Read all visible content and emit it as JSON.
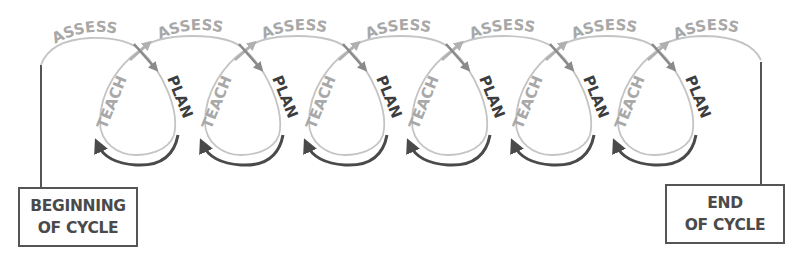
{
  "diagram": {
    "stage_labels": {
      "assess": "ASSESS",
      "plan": "PLAN",
      "teach": "TEACH"
    },
    "loop_count": 6,
    "loops": [
      {
        "assess": "ASSESS",
        "plan": "PLAN",
        "teach": "TEACH"
      },
      {
        "assess": "ASSESS",
        "plan": "PLAN",
        "teach": "TEACH"
      },
      {
        "assess": "ASSESS",
        "plan": "PLAN",
        "teach": "TEACH"
      },
      {
        "assess": "ASSESS",
        "plan": "PLAN",
        "teach": "TEACH"
      },
      {
        "assess": "ASSESS",
        "plan": "PLAN",
        "teach": "TEACH"
      },
      {
        "assess": "ASSESS",
        "plan": "PLAN",
        "teach": "TEACH"
      }
    ],
    "final_assess": "ASSESS",
    "begin_box": {
      "line1": "BEGINNING",
      "line2": "OF CYCLE"
    },
    "end_box": {
      "line1": "END",
      "line2": "OF CYCLE"
    },
    "colors": {
      "light": "#a8a8a8",
      "dark": "#4a4a4a",
      "mid": "#8a8a8a"
    }
  }
}
